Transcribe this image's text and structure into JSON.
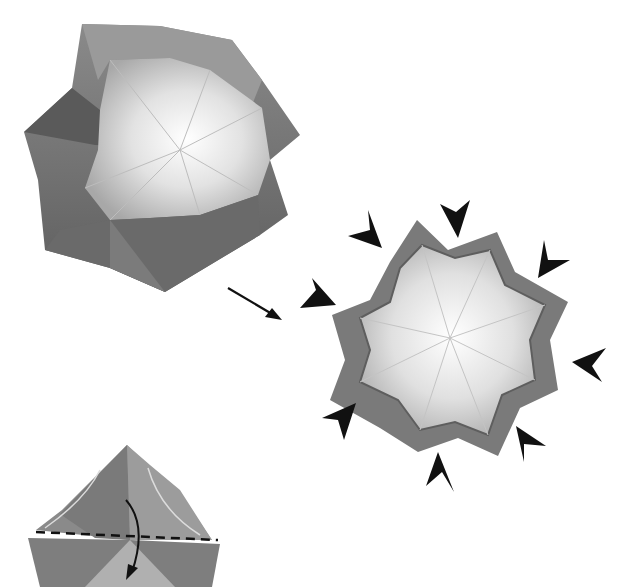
{
  "diagram": {
    "type": "origami-instruction",
    "colors": {
      "background": "#ffffff",
      "paper_dark": "#6e6e6e",
      "paper_mid": "#8c8c8c",
      "paper_light": "#e8e8e8",
      "paper_highlight": "#fafafa",
      "arrow": "#111111"
    },
    "steps": [
      {
        "id": "step-a",
        "description": "Open eight-pointed form (photo)",
        "points": 8
      },
      {
        "id": "step-b",
        "description": "Press all eight points inward (photo)",
        "points": 8,
        "push_arrows": 8
      },
      {
        "id": "step-c",
        "description": "Fold top flap down along dashed valley line (photo, partial)",
        "fold_line": "dashed",
        "fold_arrow": "curved-down"
      }
    ],
    "icons": {
      "step_arrow": "arrow-right-down-icon",
      "push_arrow": "arrowhead-icon",
      "fold_arrow": "curved-arrow-icon"
    },
    "text_labels": []
  }
}
